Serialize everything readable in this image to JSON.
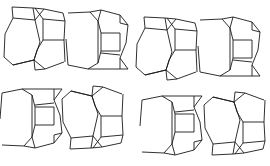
{
  "diagram": {
    "title": "",
    "stroke_color": "#1a1a1a",
    "background_color": "#ffffff",
    "rows": [
      {
        "name": "upper-chain",
        "units": 4
      },
      {
        "name": "lower-chain",
        "units": 4
      }
    ]
  }
}
